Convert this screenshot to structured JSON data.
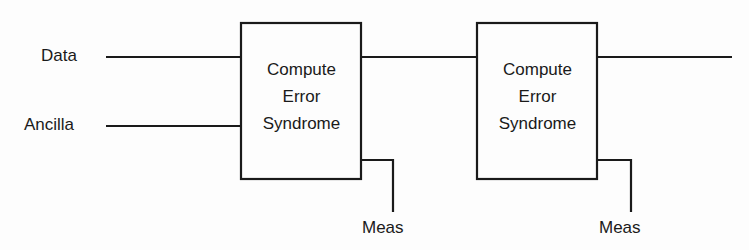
{
  "diagram": {
    "inputs": [
      {
        "label": "Data"
      },
      {
        "label": "Ancilla"
      }
    ],
    "blocks": [
      {
        "line1": "Compute",
        "line2": "Error",
        "line3": "Syndrome",
        "output_label": "Meas"
      },
      {
        "line1": "Compute",
        "line2": "Error",
        "line3": "Syndrome",
        "output_label": "Meas"
      }
    ],
    "colors": {
      "stroke": "#1a1a1a",
      "background": "#fdfdfd"
    }
  }
}
